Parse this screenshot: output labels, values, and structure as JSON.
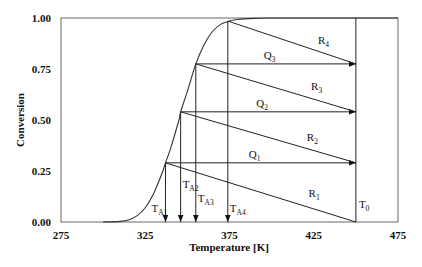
{
  "chart_data": {
    "type": "line",
    "title": "",
    "xlabel": "Temperature [K]",
    "ylabel": "Conversion",
    "xlim": [
      275,
      475
    ],
    "ylim": [
      0,
      1
    ],
    "x_ticks": [
      275,
      325,
      375,
      425,
      475
    ],
    "x_tick_labels": [
      "275",
      "325",
      "375",
      "425",
      "475"
    ],
    "y_ticks": [
      0,
      0.25,
      0.5,
      0.75,
      1.0
    ],
    "y_tick_labels": [
      "0.00",
      "0.25",
      "0.50",
      "0.75",
      "1.00"
    ],
    "grid": false,
    "legend": null,
    "series": [
      {
        "name": "Equilibrium/kinetic conversion curve",
        "x": [
          300,
          310,
          315,
          320,
          325,
          330,
          335,
          337,
          340,
          345,
          346,
          350,
          355,
          360,
          365,
          370,
          375,
          380,
          390,
          400
        ],
        "y": [
          0.0,
          0.003,
          0.01,
          0.03,
          0.07,
          0.14,
          0.24,
          0.29,
          0.36,
          0.5,
          0.54,
          0.64,
          0.775,
          0.87,
          0.935,
          0.97,
          0.985,
          0.993,
          0.998,
          1.0
        ]
      }
    ],
    "T0": 450,
    "annotations": {
      "T_A": [
        {
          "label": "T",
          "sub": "A1",
          "x": 337,
          "y_start": 0.29
        },
        {
          "label": "T",
          "sub": "A2",
          "x": 346,
          "y_start": 0.54
        },
        {
          "label": "T",
          "sub": "A3",
          "x": 355,
          "y_start": 0.775
        },
        {
          "label": "T",
          "sub": "A4",
          "x": 374,
          "y_start": 0.985
        }
      ],
      "Q_arrows": [
        {
          "label": "Q",
          "sub": "1",
          "x_from": 337,
          "x_to": 450,
          "y": 0.29
        },
        {
          "label": "Q",
          "sub": "2",
          "x_from": 346,
          "x_to": 450,
          "y": 0.54
        },
        {
          "label": "Q",
          "sub": "3",
          "x_from": 355,
          "x_to": 450,
          "y": 0.775
        }
      ],
      "R_lines": [
        {
          "label": "R",
          "sub": "1",
          "x_from": 337,
          "y_from": 0.29,
          "x_to": 450,
          "y_to": 0.0
        },
        {
          "label": "R",
          "sub": "2",
          "x_from": 346,
          "y_from": 0.54,
          "x_to": 450,
          "y_to": 0.29
        },
        {
          "label": "R",
          "sub": "3",
          "x_from": 355,
          "y_from": 0.775,
          "x_to": 450,
          "y_to": 0.54
        },
        {
          "label": "R",
          "sub": "4",
          "x_from": 374,
          "y_from": 0.985,
          "x_to": 450,
          "y_to": 0.775
        }
      ],
      "T0_label": {
        "label": "T",
        "sub": "0"
      }
    }
  }
}
